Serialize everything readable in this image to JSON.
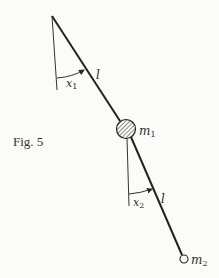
{
  "figure": {
    "caption": "Fig. 5"
  },
  "labels": {
    "angle1": "x",
    "angle1_sub": "1",
    "length1": "l",
    "mass1": "m",
    "mass1_sub": "1",
    "angle2": "x",
    "angle2_sub": "2",
    "length2": "l",
    "mass2": "m",
    "mass2_sub": "2"
  },
  "colors": {
    "ink": "#2a2a2a",
    "background": "#fbfbf7"
  }
}
